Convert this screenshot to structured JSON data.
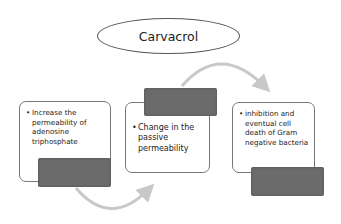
{
  "diagram": {
    "title": "Carvacrol",
    "steps": [
      {
        "bullet": "•",
        "text": "Increase the permeability of adenosine triphosphate"
      },
      {
        "bullet": "•",
        "text": "Change in the passive permeability"
      },
      {
        "bullet": "•",
        "text": "inhibition and eventual cell death of Gram negative bacteria"
      }
    ],
    "colors": {
      "arrow": "#c8c8c8",
      "label_block": "#6b6b6b",
      "border": "#777777"
    }
  }
}
